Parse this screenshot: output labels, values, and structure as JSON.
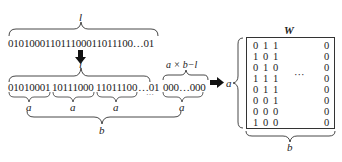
{
  "top": {
    "brace_label": "l",
    "bitstring": "010100011011100011011100…01"
  },
  "arrow_down": "down-arrow",
  "middle": {
    "brace_label": "l",
    "pad_label": "a × b−l",
    "segments": [
      "01010001",
      "10111000",
      "11011100",
      "…01",
      "000…000"
    ],
    "ellipsis_dots": "…",
    "segment_label": "a",
    "group_label": "b"
  },
  "arrow_right": "right-arrow",
  "matrix": {
    "title": "W",
    "row_label": "a",
    "col_label": "b",
    "ellipsis": "···",
    "rows": [
      [
        "0",
        "1",
        "1",
        "0"
      ],
      [
        "1",
        "0",
        "1",
        "0"
      ],
      [
        "0",
        "1",
        "0",
        "0"
      ],
      [
        "1",
        "1",
        "1",
        "0"
      ],
      [
        "0",
        "1",
        "1",
        "0"
      ],
      [
        "0",
        "0",
        "1",
        "0"
      ],
      [
        "0",
        "0",
        "0",
        "0"
      ],
      [
        "1",
        "0",
        "0",
        "0"
      ]
    ]
  }
}
